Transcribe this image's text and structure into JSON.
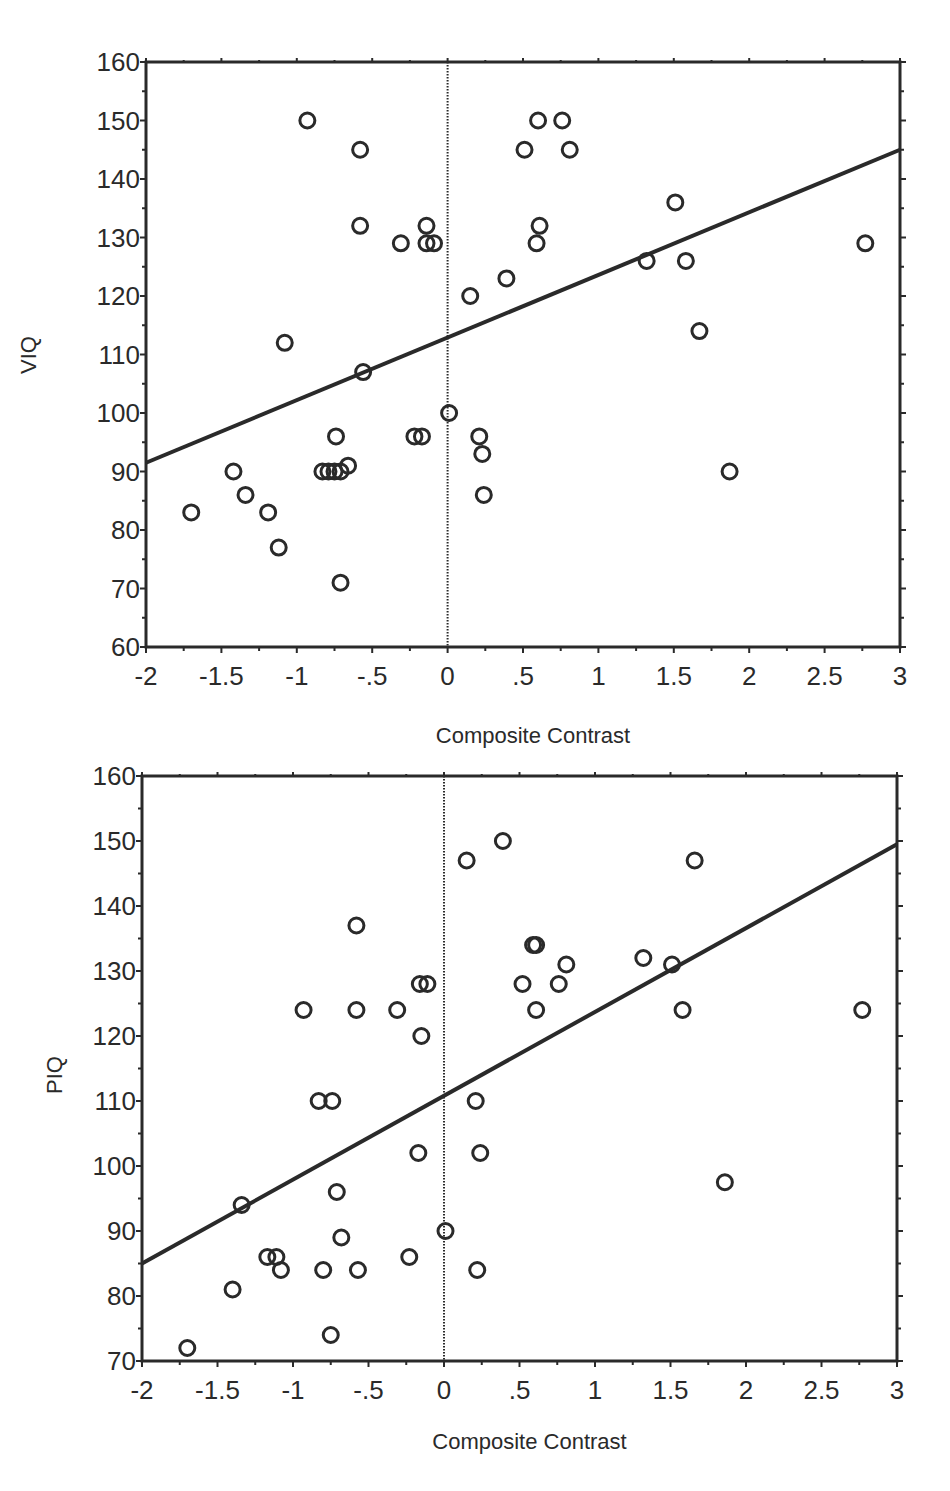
{
  "chart_data": [
    {
      "type": "scatter",
      "title": "",
      "xlabel": "Composite Contrast",
      "ylabel": "VIQ",
      "xlim": [
        -2,
        3
      ],
      "ylim": [
        60,
        160
      ],
      "xticks": [
        -2,
        -1.5,
        -1,
        -0.5,
        0,
        0.5,
        1,
        1.5,
        2,
        2.5,
        3
      ],
      "xtick_labels": [
        "-2",
        "-1.5",
        "-1",
        "-.5",
        "0",
        ".5",
        "1",
        "1.5",
        "2",
        "2.5",
        "3"
      ],
      "yticks": [
        60,
        70,
        80,
        90,
        100,
        110,
        120,
        130,
        140,
        150,
        160
      ],
      "ytick_labels": [
        "60",
        "70",
        "80",
        "90",
        "100",
        "110",
        "120",
        "130",
        "140",
        "150",
        "160"
      ],
      "grid": false,
      "reference_line_x": 0,
      "regression_line": {
        "x": [
          -2,
          3
        ],
        "y": [
          91.5,
          145
        ]
      },
      "marker": "open-circle",
      "points": [
        {
          "x": -1.7,
          "y": 83
        },
        {
          "x": -1.42,
          "y": 90
        },
        {
          "x": -1.34,
          "y": 86
        },
        {
          "x": -1.19,
          "y": 83
        },
        {
          "x": -1.12,
          "y": 77
        },
        {
          "x": -1.08,
          "y": 112
        },
        {
          "x": -0.93,
          "y": 150
        },
        {
          "x": -0.83,
          "y": 90
        },
        {
          "x": -0.79,
          "y": 90
        },
        {
          "x": -0.75,
          "y": 90
        },
        {
          "x": -0.71,
          "y": 90
        },
        {
          "x": -0.74,
          "y": 96
        },
        {
          "x": -0.66,
          "y": 91
        },
        {
          "x": -0.71,
          "y": 71
        },
        {
          "x": -0.58,
          "y": 145
        },
        {
          "x": -0.58,
          "y": 132
        },
        {
          "x": -0.56,
          "y": 107
        },
        {
          "x": -0.31,
          "y": 129
        },
        {
          "x": -0.22,
          "y": 96
        },
        {
          "x": -0.17,
          "y": 96
        },
        {
          "x": -0.14,
          "y": 132
        },
        {
          "x": -0.14,
          "y": 129
        },
        {
          "x": -0.09,
          "y": 129
        },
        {
          "x": 0.01,
          "y": 100
        },
        {
          "x": 0.15,
          "y": 120
        },
        {
          "x": 0.21,
          "y": 96
        },
        {
          "x": 0.23,
          "y": 93
        },
        {
          "x": 0.24,
          "y": 86
        },
        {
          "x": 0.39,
          "y": 123
        },
        {
          "x": 0.51,
          "y": 145
        },
        {
          "x": 0.59,
          "y": 129
        },
        {
          "x": 0.6,
          "y": 150
        },
        {
          "x": 0.61,
          "y": 132
        },
        {
          "x": 0.76,
          "y": 150
        },
        {
          "x": 0.81,
          "y": 145
        },
        {
          "x": 1.32,
          "y": 126
        },
        {
          "x": 1.51,
          "y": 136
        },
        {
          "x": 1.58,
          "y": 126
        },
        {
          "x": 1.67,
          "y": 114
        },
        {
          "x": 1.87,
          "y": 90
        },
        {
          "x": 2.77,
          "y": 129
        }
      ]
    },
    {
      "type": "scatter",
      "title": "",
      "xlabel": "Composite Contrast",
      "ylabel": "PIQ",
      "xlim": [
        -2,
        3
      ],
      "ylim": [
        70,
        160
      ],
      "xticks": [
        -2,
        -1.5,
        -1,
        -0.5,
        0,
        0.5,
        1,
        1.5,
        2,
        2.5,
        3
      ],
      "xtick_labels": [
        "-2",
        "-1.5",
        "-1",
        "-.5",
        "0",
        ".5",
        "1",
        "1.5",
        "2",
        "2.5",
        "3"
      ],
      "yticks": [
        70,
        80,
        90,
        100,
        110,
        120,
        130,
        140,
        150,
        160
      ],
      "ytick_labels": [
        "70",
        "80",
        "90",
        "100",
        "110",
        "120",
        "130",
        "140",
        "150",
        "160"
      ],
      "grid": false,
      "reference_line_x": 0,
      "regression_line": {
        "x": [
          -2,
          3
        ],
        "y": [
          85,
          149.5
        ]
      },
      "marker": "open-circle",
      "points": [
        {
          "x": -1.7,
          "y": 72
        },
        {
          "x": -1.4,
          "y": 81
        },
        {
          "x": -1.34,
          "y": 94
        },
        {
          "x": -1.17,
          "y": 86
        },
        {
          "x": -1.11,
          "y": 86
        },
        {
          "x": -1.08,
          "y": 84
        },
        {
          "x": -0.93,
          "y": 124
        },
        {
          "x": -0.83,
          "y": 110
        },
        {
          "x": -0.74,
          "y": 110
        },
        {
          "x": -0.8,
          "y": 84
        },
        {
          "x": -0.75,
          "y": 74
        },
        {
          "x": -0.71,
          "y": 96
        },
        {
          "x": -0.68,
          "y": 89
        },
        {
          "x": -0.58,
          "y": 137
        },
        {
          "x": -0.58,
          "y": 124
        },
        {
          "x": -0.57,
          "y": 84
        },
        {
          "x": -0.31,
          "y": 124
        },
        {
          "x": -0.23,
          "y": 86
        },
        {
          "x": -0.17,
          "y": 102
        },
        {
          "x": -0.16,
          "y": 128
        },
        {
          "x": -0.15,
          "y": 120
        },
        {
          "x": -0.11,
          "y": 128
        },
        {
          "x": 0.01,
          "y": 90
        },
        {
          "x": 0.15,
          "y": 147
        },
        {
          "x": 0.21,
          "y": 110
        },
        {
          "x": 0.22,
          "y": 84
        },
        {
          "x": 0.24,
          "y": 102
        },
        {
          "x": 0.39,
          "y": 150
        },
        {
          "x": 0.52,
          "y": 128
        },
        {
          "x": 0.59,
          "y": 134
        },
        {
          "x": 0.61,
          "y": 134
        },
        {
          "x": 0.61,
          "y": 124
        },
        {
          "x": 0.76,
          "y": 128
        },
        {
          "x": 0.81,
          "y": 131
        },
        {
          "x": 1.32,
          "y": 132
        },
        {
          "x": 1.51,
          "y": 131
        },
        {
          "x": 1.58,
          "y": 124
        },
        {
          "x": 1.66,
          "y": 147
        },
        {
          "x": 1.86,
          "y": 97.5
        },
        {
          "x": 2.77,
          "y": 124
        }
      ]
    }
  ],
  "colors": {
    "ink": "#2a2a2a",
    "background": "#ffffff"
  }
}
